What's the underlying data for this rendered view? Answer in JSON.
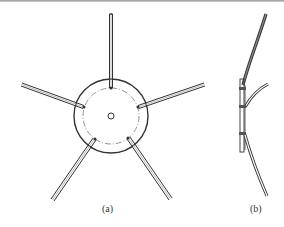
{
  "figure": {
    "panels": [
      {
        "id": "a",
        "label": "(a)",
        "description": "Top view of five-arm star with hub"
      },
      {
        "id": "b",
        "label": "(b)",
        "description": "Side view of curved arms"
      }
    ],
    "colors": {
      "stroke": "#333333",
      "background": "#ffffff"
    }
  }
}
